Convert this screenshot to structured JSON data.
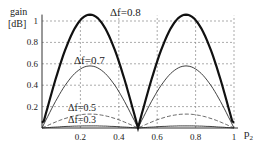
{
  "chart_data": {
    "type": "line",
    "title": "",
    "xlabel": "p2",
    "ylabel": "gain [dB]",
    "xlim": [
      0,
      1
    ],
    "ylim": [
      0,
      1.05
    ],
    "grid": true,
    "x_ticks": [
      "0.2",
      "0.4",
      "0.6",
      "0.8",
      "1"
    ],
    "y_ticks": [
      "0.2",
      "0.4",
      "0.6",
      "0.8",
      "1"
    ],
    "series": [
      {
        "name": "Δf=0.8",
        "peak": 1.06,
        "style": "thick-solid",
        "x": [
          0,
          0.1,
          0.2,
          0.25,
          0.3,
          0.4,
          0.5,
          0.6,
          0.7,
          0.75,
          0.8,
          0.9,
          1
        ],
        "y": [
          0.05,
          0.62,
          0.98,
          1.06,
          1.0,
          0.62,
          0.0,
          0.62,
          1.0,
          1.06,
          0.98,
          0.62,
          0.05
        ]
      },
      {
        "name": "Δf=0.7",
        "peak": 0.58,
        "style": "thin-solid",
        "x": [
          0,
          0.1,
          0.2,
          0.25,
          0.3,
          0.4,
          0.5,
          0.6,
          0.7,
          0.75,
          0.8,
          0.9,
          1
        ],
        "y": [
          0.02,
          0.32,
          0.54,
          0.58,
          0.55,
          0.33,
          0.0,
          0.33,
          0.55,
          0.58,
          0.54,
          0.32,
          0.02
        ]
      },
      {
        "name": "Δf=0.5",
        "peak": 0.13,
        "style": "dashed",
        "x": [
          0,
          0.1,
          0.2,
          0.25,
          0.3,
          0.4,
          0.5,
          0.6,
          0.7,
          0.75,
          0.8,
          0.9,
          1
        ],
        "y": [
          0.0,
          0.07,
          0.12,
          0.13,
          0.12,
          0.07,
          0.0,
          0.07,
          0.12,
          0.13,
          0.12,
          0.07,
          0.0
        ]
      },
      {
        "name": "Δf=0.3",
        "peak": 0.02,
        "style": "thin-solid",
        "x": [
          0,
          0.25,
          0.5,
          0.75,
          1
        ],
        "y": [
          0.0,
          0.02,
          0.0,
          0.02,
          0.0
        ]
      }
    ],
    "annotations": [
      "Δf=0.8",
      "Δf=0.7",
      "Δf=0.5",
      "Δf=0.3"
    ]
  },
  "labels": {
    "ylabel_line1": "gain",
    "ylabel_line2": "[dB]",
    "xlabel_main": "p",
    "xlabel_sub": "2",
    "ann_08": "Δf=0.8",
    "ann_07": "Δf=0.7",
    "ann_05": "Δf=0.5",
    "ann_03": "Δf=0.3"
  }
}
